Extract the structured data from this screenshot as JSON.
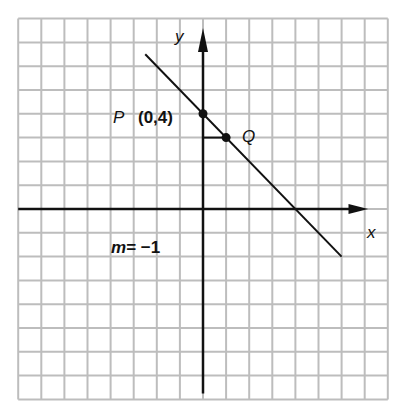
{
  "diagram": {
    "type": "coordinate-plane",
    "grid": {
      "x_range": [
        -8,
        8
      ],
      "y_range": [
        -8,
        8
      ]
    },
    "axes": {
      "x_label": "x",
      "y_label": "y"
    },
    "line": {
      "slope": -1,
      "y_intercept": 4,
      "x_from": -2.5,
      "x_to": 6
    },
    "points": [
      {
        "name": "P",
        "x": 0,
        "y": 4,
        "label": "P",
        "coord_label": "(0,4)"
      },
      {
        "name": "Q",
        "x": 1,
        "y": 3,
        "label": "Q"
      }
    ],
    "slope_label_m": "m",
    "slope_label_eq": "= −1",
    "colors": {
      "grid": "#bdbdbd",
      "ink": "#111111"
    }
  }
}
